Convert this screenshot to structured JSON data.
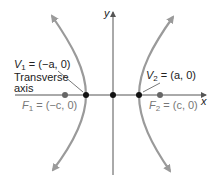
{
  "diagram": {
    "type": "hyperbola",
    "axes": {
      "x_label": "x",
      "y_label": "y"
    },
    "vertex_1": {
      "name": "V",
      "sub": "1",
      "value": "= (−a, 0)"
    },
    "vertex_2": {
      "name": "V",
      "sub": "2",
      "value": "= (a, 0)"
    },
    "focus_1": {
      "name": "F",
      "sub": "1",
      "value": "= (−c, 0)"
    },
    "focus_2": {
      "name": "F",
      "sub": "2",
      "value": "= (c, 0)"
    },
    "transverse_axis_line1": "Transverse",
    "transverse_axis_line2": "axis",
    "colors": {
      "curve": "#9a9a9a",
      "axis": "#555555",
      "vertex_point": "#111111",
      "focus_point": "#666666"
    }
  }
}
